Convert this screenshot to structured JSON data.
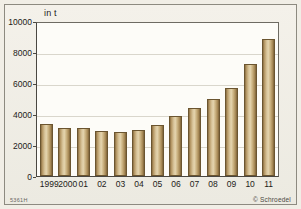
{
  "chart_data": {
    "type": "bar",
    "title": "",
    "subtitle": "",
    "unit_label": "in t",
    "xlabel": "",
    "ylabel": "in t",
    "ylim": [
      0,
      10000
    ],
    "yticks": [
      0,
      2000,
      4000,
      6000,
      8000,
      10000
    ],
    "grid": true,
    "legend": null,
    "categories": [
      "1999",
      "2000",
      "01",
      "02",
      "03",
      "04",
      "05",
      "06",
      "07",
      "08",
      "09",
      "10",
      "11"
    ],
    "values": [
      3350,
      3100,
      3150,
      2950,
      2850,
      3000,
      3300,
      3900,
      4400,
      5000,
      5700,
      7300,
      8900
    ],
    "bar_color": "#d8c49a",
    "bar_edge_color": "#6b5530"
  },
  "footer": {
    "code": "5361H",
    "credit": "© Schroedel"
  }
}
